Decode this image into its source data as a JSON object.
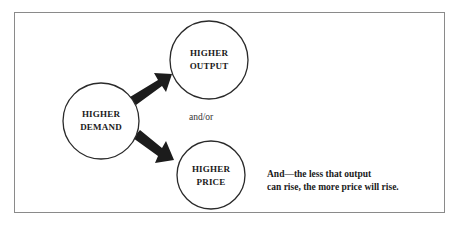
{
  "diagram": {
    "nodes": {
      "demand": {
        "line1": "HIGHER",
        "line2": "DEMAND"
      },
      "output": {
        "line1": "HIGHER",
        "line2": "OUTPUT"
      },
      "price": {
        "line1": "HIGHER",
        "line2": "PRICE"
      }
    },
    "connector_label": "and/or",
    "note": {
      "line1": "And—the less that output",
      "line2": "can rise, the more price will rise."
    },
    "edges": [
      {
        "from": "demand",
        "to": "output",
        "style": "thick-black-arrow"
      },
      {
        "from": "demand",
        "to": "price",
        "style": "thick-black-arrow"
      }
    ],
    "colors": {
      "arrow": "#1c1c1c",
      "circle_stroke": "#2a2a2a",
      "frame": "#8a8a8a",
      "background": "#ffffff"
    }
  }
}
